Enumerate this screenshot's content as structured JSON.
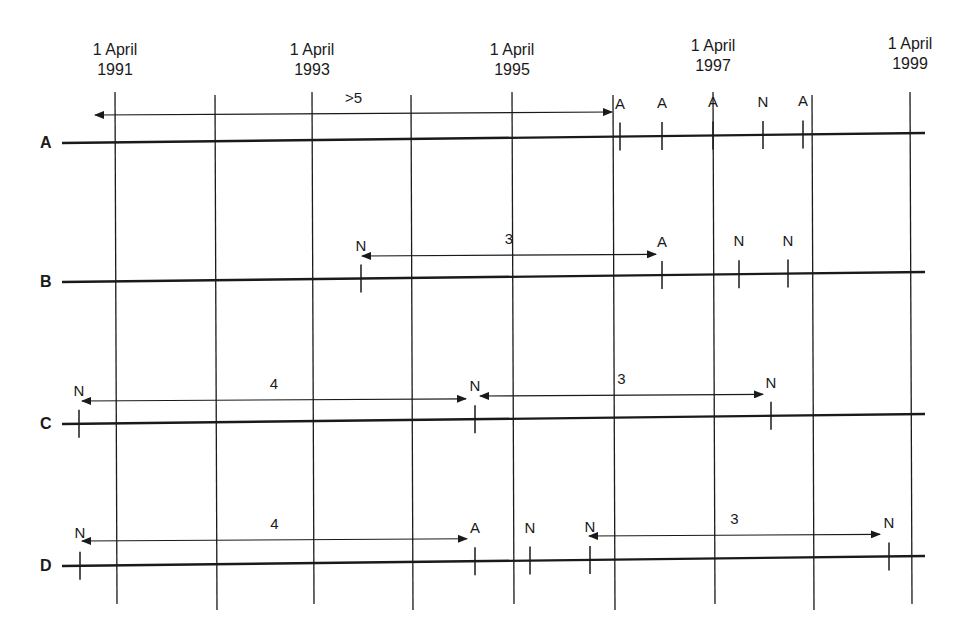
{
  "diagram": {
    "type": "timeline",
    "colors": {
      "line": "#1a1a1a",
      "background": "#ffffff"
    },
    "year_columns": [
      {
        "label_line1": "1 April",
        "label_line2": "1991",
        "x": 115
      },
      {
        "label_line1": "1 April",
        "label_line2": "1993",
        "x": 312
      },
      {
        "label_line1": "1 April",
        "label_line2": "1995",
        "x": 512
      },
      {
        "label_line1": "1 April",
        "label_line2": "1997",
        "x": 713
      },
      {
        "label_line1": "1 April",
        "label_line2": "1999",
        "x": 910
      }
    ],
    "intermediate_columns_x": [
      215,
      411,
      613,
      812
    ],
    "rows": [
      {
        "label": "A",
        "y": 143,
        "events": [
          {
            "type": "A",
            "x": 620
          },
          {
            "type": "A",
            "x": 662
          },
          {
            "type": "A",
            "x": 713
          },
          {
            "type": "N",
            "x": 763
          },
          {
            "type": "A",
            "x": 803
          }
        ],
        "spans": [
          {
            "label": ">5",
            "x1": 95,
            "x2": 612,
            "y": 115,
            "arrow_left": true,
            "arrow_right": true
          }
        ]
      },
      {
        "label": "B",
        "y": 282,
        "events": [
          {
            "type": "N",
            "x": 361
          },
          {
            "type": "A",
            "x": 662
          },
          {
            "type": "N",
            "x": 739
          },
          {
            "type": "N",
            "x": 788
          }
        ],
        "spans": [
          {
            "label": "3",
            "x1": 362,
            "x2": 656,
            "y": 256,
            "arrow_left": true,
            "arrow_right": true
          }
        ]
      },
      {
        "label": "C",
        "y": 424,
        "events": [
          {
            "type": "N",
            "x": 79
          },
          {
            "type": "N",
            "x": 475
          },
          {
            "type": "N",
            "x": 771
          }
        ],
        "spans": [
          {
            "label": "4",
            "x1": 82,
            "x2": 466,
            "y": 401,
            "arrow_left": true,
            "arrow_right": true
          },
          {
            "label": "3",
            "x1": 480,
            "x2": 763,
            "y": 396,
            "arrow_left": true,
            "arrow_right": true
          }
        ]
      },
      {
        "label": "D",
        "y": 566,
        "events": [
          {
            "type": "N",
            "x": 80
          },
          {
            "type": "A",
            "x": 475
          },
          {
            "type": "N",
            "x": 530
          },
          {
            "type": "N",
            "x": 590
          },
          {
            "type": "N",
            "x": 889
          }
        ],
        "spans": [
          {
            "label": "4",
            "x1": 82,
            "x2": 467,
            "y": 541,
            "arrow_left": true,
            "arrow_right": true
          },
          {
            "label": "3",
            "x1": 589,
            "x2": 880,
            "y": 536,
            "arrow_left": true,
            "arrow_right": true
          }
        ]
      }
    ]
  }
}
